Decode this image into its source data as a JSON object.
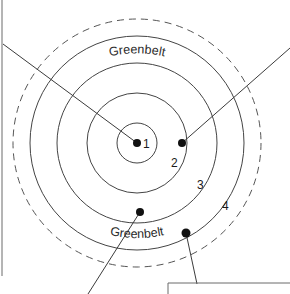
{
  "figure": {
    "center": {
      "x": 137,
      "y": 143
    }
  },
  "greenbelt": {
    "top_label": "Greenbelt",
    "bottom_label": "Greenbelt",
    "radius": 124,
    "style": "dashed"
  },
  "rings": [
    {
      "id": "ring-1",
      "label": "1",
      "radius": 20,
      "label_x": 143,
      "label_y": 148
    },
    {
      "id": "ring-2",
      "label": "2",
      "radius": 50,
      "label_x": 171,
      "label_y": 167
    },
    {
      "id": "ring-3",
      "label": "3",
      "radius": 80,
      "label_x": 197,
      "label_y": 189
    },
    {
      "id": "ring-4",
      "label": "4",
      "radius": 107,
      "label_x": 222,
      "label_y": 210
    }
  ],
  "site_dots": [
    {
      "id": "dot-centre",
      "x": 137,
      "y": 143
    },
    {
      "id": "dot-upper-right",
      "x": 182,
      "y": 143
    },
    {
      "id": "dot-lower-left",
      "x": 140,
      "y": 212
    },
    {
      "id": "dot-lower-right",
      "x": 186,
      "y": 233
    }
  ],
  "leaders": [
    {
      "id": "leader-upper-left",
      "x1": 3,
      "y1": 44,
      "x2": 137,
      "y2": 143
    },
    {
      "id": "leader-upper-right",
      "x1": 290,
      "y1": 48,
      "x2": 182,
      "y2": 143
    },
    {
      "id": "leader-lower-left",
      "x1": 88,
      "y1": 294,
      "x2": 140,
      "y2": 212
    },
    {
      "id": "leader-lower-right",
      "x1": 197,
      "y1": 284,
      "x2": 186,
      "y2": 233
    }
  ],
  "frame": {
    "left_rule": {
      "x": 2,
      "y1": 0,
      "y2": 276
    },
    "callout_box": {
      "x": 168,
      "y": 283,
      "width": 122,
      "height": 11
    }
  },
  "colors": {
    "ink": "#3b3b3b",
    "ring_stroke": "#444444",
    "belt_stroke": "#555555",
    "dot_fill": "#111111",
    "frame_stroke": "#6b6b6b",
    "background": "#ffffff"
  }
}
